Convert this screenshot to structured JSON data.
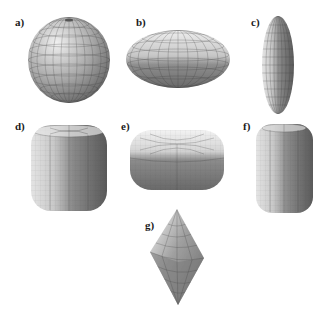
{
  "figure": {
    "panels": [
      {
        "id": "a",
        "label": "a)",
        "shape": "sphere"
      },
      {
        "id": "b",
        "label": "b)",
        "shape": "oblate-spheroid"
      },
      {
        "id": "c",
        "label": "c)",
        "shape": "prolate-spheroid"
      },
      {
        "id": "d",
        "label": "d)",
        "shape": "rounded-cube"
      },
      {
        "id": "e",
        "label": "e)",
        "shape": "flattened-rounded-box"
      },
      {
        "id": "f",
        "label": "f)",
        "shape": "elongated-rounded-box"
      },
      {
        "id": "g",
        "label": "g)",
        "shape": "bicone"
      }
    ],
    "colors": {
      "background": "#ffffff",
      "surface_light": "#e8e8e8",
      "surface_mid": "#a6a6a6",
      "surface_dark": "#5a5a5a",
      "mesh": "#3a3a3a",
      "label": "#1a1a1a"
    }
  }
}
